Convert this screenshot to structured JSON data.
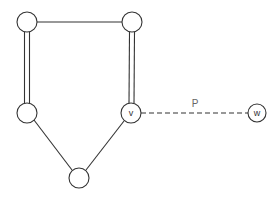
{
  "diagram": {
    "nodes": [
      {
        "id": "a",
        "label": "",
        "x": 27,
        "y": 22,
        "r": 10
      },
      {
        "id": "b",
        "label": "",
        "x": 132,
        "y": 22,
        "r": 10
      },
      {
        "id": "c",
        "label": "",
        "x": 27,
        "y": 113,
        "r": 10
      },
      {
        "id": "v",
        "label": "v",
        "x": 131,
        "y": 113,
        "r": 10
      },
      {
        "id": "d",
        "label": "",
        "x": 79,
        "y": 178,
        "r": 10
      },
      {
        "id": "w",
        "label": "w",
        "x": 257,
        "y": 113,
        "r": 9
      }
    ],
    "edges": [
      {
        "from": "a",
        "to": "b",
        "style": "single"
      },
      {
        "from": "a",
        "to": "c",
        "style": "double"
      },
      {
        "from": "b",
        "to": "v",
        "style": "double"
      },
      {
        "from": "c",
        "to": "d",
        "style": "single"
      },
      {
        "from": "v",
        "to": "d",
        "style": "single"
      },
      {
        "from": "v",
        "to": "w",
        "style": "dashed",
        "label": "P"
      }
    ],
    "path_label": "P"
  }
}
